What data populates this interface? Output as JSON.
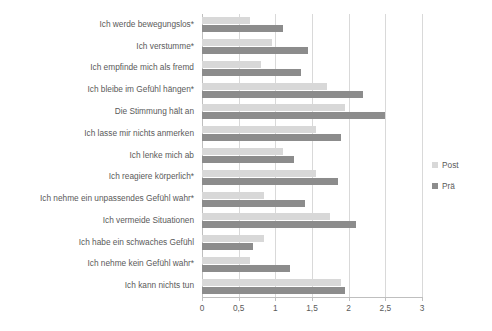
{
  "chart_data": {
    "type": "bar",
    "orientation": "horizontal",
    "title": "",
    "subtitle": "",
    "xlabel": "",
    "ylabel": "",
    "xlim": [
      0,
      3
    ],
    "xticks": [
      0,
      0.5,
      1,
      1.5,
      2,
      2.5,
      3
    ],
    "xtick_labels": [
      "0",
      "0,5",
      "1",
      "1,5",
      "2",
      "2,5",
      "3"
    ],
    "grid": true,
    "grid_axis": "x",
    "legend_position": "right",
    "categories": [
      "Ich werde bewegungslos*",
      "Ich verstumme*",
      "Ich empfinde mich als fremd",
      "Ich bleibe im Gefühl hängen*",
      "Die Stimmung hält an",
      "Ich lasse mir nichts anmerken",
      "Ich lenke mich ab",
      "Ich reagiere körperlich*",
      "Ich nehme ein unpassendes Gefühl wahr*",
      "Ich vermeide Situationen",
      "Ich habe ein schwaches Gefühl",
      "Ich nehme kein Gefühl wahr*",
      "Ich kann nichts tun"
    ],
    "series": [
      {
        "name": "Post",
        "color": "#d8d8d8",
        "values": [
          0.65,
          0.95,
          0.8,
          1.7,
          1.95,
          1.55,
          1.1,
          1.55,
          0.85,
          1.75,
          0.85,
          0.65,
          1.9
        ]
      },
      {
        "name": "Prä",
        "color": "#8c8c8c",
        "values": [
          1.1,
          1.45,
          1.35,
          2.2,
          2.5,
          1.9,
          1.25,
          1.85,
          1.4,
          2.1,
          0.7,
          1.2,
          1.95
        ]
      }
    ]
  },
  "legend": {
    "items": [
      {
        "label": "Post",
        "color": "#d8d8d8"
      },
      {
        "label": "Prä",
        "color": "#8c8c8c"
      }
    ]
  },
  "colors": {
    "post": "#d8d8d8",
    "prae": "#8c8c8c",
    "grid": "#d9d9d9",
    "axis": "#bfbfbf",
    "text": "#5a5a5a",
    "background": "#ffffff"
  }
}
